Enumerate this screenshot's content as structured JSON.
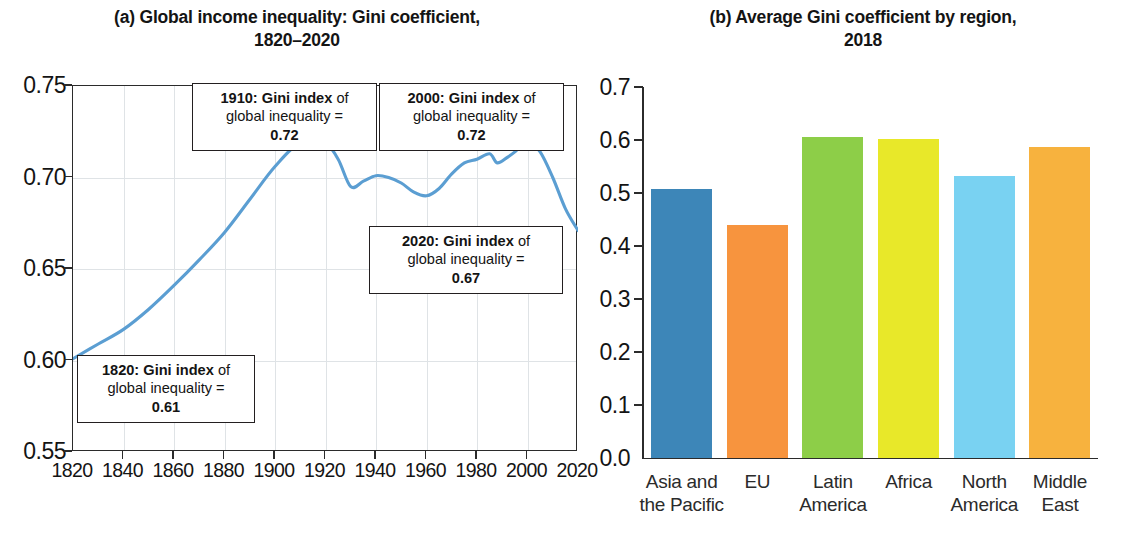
{
  "panel_a": {
    "title_line1": "(a) Global income inequality: Gini coefficient,",
    "title_line2": "1820–2020",
    "annotations": [
      {
        "id": "ann-1910",
        "year": "1910:",
        "label_bold": "Gini index",
        "label_rest": " of",
        "line2": "global inequality =",
        "value": "0.72"
      },
      {
        "id": "ann-2000",
        "year": "2000:",
        "label_bold": "Gini index",
        "label_rest": " of",
        "line2": "global inequality =",
        "value": "0.72"
      },
      {
        "id": "ann-2020",
        "year": "2020:",
        "label_bold": "Gini index",
        "label_rest": " of",
        "line2": "global inequality =",
        "value": "0.67"
      },
      {
        "id": "ann-1820",
        "year": "1820:",
        "label_bold": "Gini index",
        "label_rest": " of",
        "line2": "global inequality =",
        "value": "0.61"
      }
    ]
  },
  "panel_b": {
    "title_line1": "(b) Average Gini coefficient by region,",
    "title_line2": "2018"
  },
  "colors": {
    "line": "#5b9ed2",
    "axis": "#2b2b2b",
    "grid": "#dfe3e6",
    "bar_asia": "#3d86b8",
    "bar_eu": "#f7943e",
    "bar_latin": "#8dce48",
    "bar_africa": "#e8e829",
    "bar_north": "#79d2f2",
    "bar_middle": "#f7b23e"
  },
  "chart_data": [
    {
      "type": "line",
      "title": "(a) Global income inequality: Gini coefficient, 1820–2020",
      "xlabel": "",
      "ylabel": "",
      "xlim": [
        1820,
        2020
      ],
      "ylim": [
        0.55,
        0.75
      ],
      "xticks": [
        "1820",
        "1840",
        "1860",
        "1880",
        "1900",
        "1920",
        "1940",
        "1960",
        "1980",
        "2000",
        "2020"
      ],
      "yticks": [
        "0.55",
        "0.60",
        "0.65",
        "0.70",
        "0.75"
      ],
      "grid": true,
      "legend": "none",
      "series": [
        {
          "name": "Gini index of global inequality",
          "x": [
            1820,
            1830,
            1840,
            1850,
            1860,
            1870,
            1880,
            1890,
            1900,
            1910,
            1920,
            1925,
            1930,
            1935,
            1940,
            1945,
            1950,
            1955,
            1960,
            1965,
            1970,
            1975,
            1980,
            1985,
            1988,
            1992,
            1995,
            2000,
            2005,
            2010,
            2015,
            2020
          ],
          "values": [
            0.601,
            0.609,
            0.617,
            0.628,
            0.641,
            0.655,
            0.67,
            0.688,
            0.706,
            0.719,
            0.718,
            0.71,
            0.695,
            0.698,
            0.701,
            0.7,
            0.697,
            0.692,
            0.69,
            0.694,
            0.702,
            0.708,
            0.71,
            0.713,
            0.708,
            0.711,
            0.714,
            0.72,
            0.714,
            0.7,
            0.683,
            0.671
          ]
        }
      ],
      "annotations": [
        {
          "x": 1910,
          "y": 0.72,
          "text": "1910: Gini index of global inequality = 0.72"
        },
        {
          "x": 2000,
          "y": 0.72,
          "text": "2000: Gini index of global inequality = 0.72"
        },
        {
          "x": 2020,
          "y": 0.67,
          "text": "2020: Gini index of global inequality = 0.67"
        },
        {
          "x": 1820,
          "y": 0.61,
          "text": "1820: Gini index of global inequality = 0.61"
        }
      ]
    },
    {
      "type": "bar",
      "title": "(b) Average Gini coefficient by region, 2018",
      "xlabel": "",
      "ylabel": "",
      "ylim": [
        0.0,
        0.7
      ],
      "yticks": [
        "0.0",
        "0.1",
        "0.2",
        "0.3",
        "0.4",
        "0.5",
        "0.6",
        "0.7"
      ],
      "grid": false,
      "legend": "none",
      "categories": [
        "Asia and the Pacific",
        "EU",
        "Latin America",
        "Africa",
        "North America",
        "Middle East"
      ],
      "category_lines": [
        [
          "Asia and",
          "the Pacific"
        ],
        [
          "EU",
          ""
        ],
        [
          "Latin",
          "America"
        ],
        [
          "Africa",
          ""
        ],
        [
          "North",
          "America"
        ],
        [
          "Middle",
          "East"
        ]
      ],
      "values": [
        0.507,
        0.44,
        0.605,
        0.601,
        0.533,
        0.587
      ],
      "bar_colors": [
        "#3d86b8",
        "#f7943e",
        "#8dce48",
        "#e8e829",
        "#79d2f2",
        "#f7b23e"
      ]
    }
  ]
}
